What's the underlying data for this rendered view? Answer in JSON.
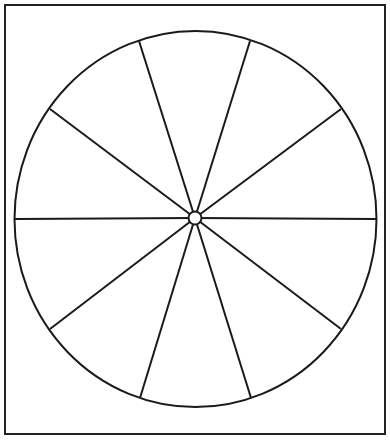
{
  "diagram": {
    "type": "blank-pie-wheel",
    "sectors": 10,
    "frame": {
      "x": 5,
      "y": 5,
      "width": 380,
      "height": 429,
      "stroke": "#222222",
      "stroke_width": 2
    },
    "ellipse": {
      "cx": 195.5,
      "cy": 219,
      "rx": 181,
      "ry": 188,
      "stroke": "#1a1a1a",
      "stroke_width": 2
    },
    "hub": {
      "cx": 195,
      "cy": 218,
      "r": 6.5,
      "stroke": "#1a1a1a",
      "stroke_width": 2
    },
    "spokes": [
      {
        "x": 139,
        "y": 41
      },
      {
        "x": 250,
        "y": 41
      },
      {
        "x": 341,
        "y": 109
      },
      {
        "x": 376,
        "y": 219
      },
      {
        "x": 341,
        "y": 329
      },
      {
        "x": 251,
        "y": 398
      },
      {
        "x": 140,
        "y": 398
      },
      {
        "x": 50,
        "y": 329
      },
      {
        "x": 15,
        "y": 219
      },
      {
        "x": 50,
        "y": 109
      }
    ],
    "line_color": "#1a1a1a",
    "background": "#ffffff"
  }
}
